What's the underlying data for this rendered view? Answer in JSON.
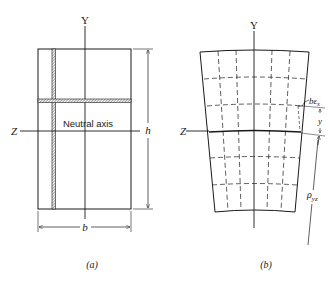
{
  "figure": {
    "panel_a": {
      "caption": "(a)",
      "axis_y_label": "Y",
      "axis_z_label": "Z",
      "neutral_axis_label": "Neutral axis",
      "height_label": "h",
      "width_label": "b"
    },
    "panel_b": {
      "caption": "(b)",
      "axis_y_label": "Y",
      "axis_z_label": "Z",
      "strain_label": "bε",
      "strain_sub": "x",
      "y_label": "y",
      "radius_label": "ρ",
      "radius_sub": "yz"
    }
  },
  "colors": {
    "line": "#1a1a1a",
    "hatch": "#555555",
    "background": "#ffffff"
  }
}
